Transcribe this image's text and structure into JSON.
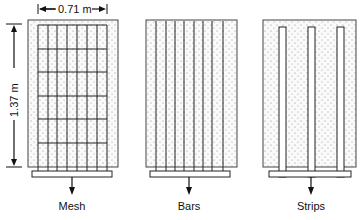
{
  "figure": {
    "dimensions": {
      "width_label": "0.71 m",
      "height_label": "1.37 m"
    },
    "panels": [
      {
        "id": "mesh",
        "label": "Mesh",
        "reinforcement": "grid of vertical and horizontal wires"
      },
      {
        "id": "bars",
        "label": "Bars",
        "reinforcement": "8 vertical bars"
      },
      {
        "id": "strips",
        "label": "Strips",
        "reinforcement": "3 vertical strips"
      }
    ]
  }
}
